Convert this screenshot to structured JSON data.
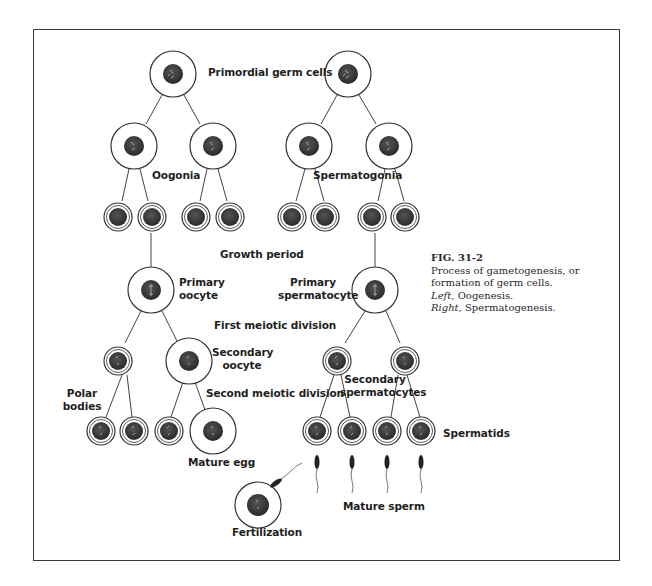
{
  "figure": {
    "number": "FIG. 31-2",
    "caption_line1": "Process of gametogenesis, or",
    "caption_line2": "formation of germ cells.",
    "left_label": "Left,",
    "left_value": "Oogenesis.",
    "right_label": "Right,",
    "right_value": "Spermatogenesis."
  },
  "labels": {
    "primordial": "Primordial germ cells",
    "oogonia": "Oogonia",
    "spermatogonia": "Spermatogonia",
    "growth": "Growth period",
    "primary_oocyte_1": "Primary",
    "primary_oocyte_2": "oocyte",
    "primary_spermatocyte_1": "Primary",
    "primary_spermatocyte_2": "spermatocyte",
    "first_meiotic": "First meiotic division",
    "secondary_oocyte_1": "Secondary",
    "secondary_oocyte_2": "oocyte",
    "polar_1": "Polar",
    "polar_2": "bodies",
    "second_meiotic": "Second meiotic division",
    "secondary_spermatocytes_1": "Secondary",
    "secondary_spermatocytes_2": "spermatocytes",
    "spermatids": "Spermatids",
    "mature_egg": "Mature egg",
    "mature_sperm": "Mature sperm",
    "fertilization": "Fertilization"
  },
  "colors": {
    "line": "#3a3a3a",
    "nucleus": "#3c3c3c",
    "cell_fill": "#ffffff"
  }
}
